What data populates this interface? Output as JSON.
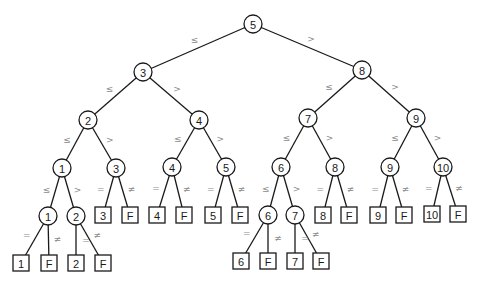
{
  "diagram": {
    "colors": {
      "line": "#1a1a1a",
      "label": "#8a8a8a",
      "background": "#ffffff"
    },
    "node_radius": 9,
    "box_size": 16,
    "nodes": [
      {
        "id": "n5",
        "type": "circle",
        "label": "5",
        "x": 253,
        "y": 24
      },
      {
        "id": "n3",
        "type": "circle",
        "label": "3",
        "x": 143,
        "y": 72
      },
      {
        "id": "n8",
        "type": "circle",
        "label": "8",
        "x": 362,
        "y": 70
      },
      {
        "id": "n2",
        "type": "circle",
        "label": "2",
        "x": 88,
        "y": 120
      },
      {
        "id": "n4",
        "type": "circle",
        "label": "4",
        "x": 199,
        "y": 120
      },
      {
        "id": "n7",
        "type": "circle",
        "label": "7",
        "x": 308,
        "y": 118
      },
      {
        "id": "n9",
        "type": "circle",
        "label": "9",
        "x": 416,
        "y": 118
      },
      {
        "id": "n1",
        "type": "circle",
        "label": "1",
        "x": 62,
        "y": 168
      },
      {
        "id": "n3b",
        "type": "circle",
        "label": "3",
        "x": 116,
        "y": 168
      },
      {
        "id": "n4b",
        "type": "circle",
        "label": "4",
        "x": 172,
        "y": 167
      },
      {
        "id": "n5b",
        "type": "circle",
        "label": "5",
        "x": 226,
        "y": 167
      },
      {
        "id": "n6",
        "type": "circle",
        "label": "6",
        "x": 281,
        "y": 167
      },
      {
        "id": "n8b",
        "type": "circle",
        "label": "8",
        "x": 335,
        "y": 167
      },
      {
        "id": "n9b",
        "type": "circle",
        "label": "9",
        "x": 390,
        "y": 167
      },
      {
        "id": "n10",
        "type": "circle",
        "label": "10",
        "x": 443,
        "y": 167
      },
      {
        "id": "n1b",
        "type": "circle",
        "label": "1",
        "x": 48,
        "y": 216
      },
      {
        "id": "n2b",
        "type": "circle",
        "label": "2",
        "x": 76,
        "y": 216
      },
      {
        "id": "n6b",
        "type": "circle",
        "label": "6",
        "x": 268,
        "y": 215
      },
      {
        "id": "n7b",
        "type": "circle",
        "label": "7",
        "x": 295,
        "y": 215
      },
      {
        "id": "l3",
        "type": "box",
        "label": "3",
        "x": 103,
        "y": 215
      },
      {
        "id": "l3f",
        "type": "box",
        "label": "F",
        "x": 130,
        "y": 215
      },
      {
        "id": "l4",
        "type": "box",
        "label": "4",
        "x": 157,
        "y": 215
      },
      {
        "id": "l4f",
        "type": "box",
        "label": "F",
        "x": 184,
        "y": 215
      },
      {
        "id": "l5",
        "type": "box",
        "label": "5",
        "x": 213,
        "y": 215
      },
      {
        "id": "l5f",
        "type": "box",
        "label": "F",
        "x": 240,
        "y": 215
      },
      {
        "id": "l8",
        "type": "box",
        "label": "8",
        "x": 323,
        "y": 215
      },
      {
        "id": "l8f",
        "type": "box",
        "label": "F",
        "x": 349,
        "y": 215
      },
      {
        "id": "l9",
        "type": "box",
        "label": "9",
        "x": 378,
        "y": 215
      },
      {
        "id": "l9f",
        "type": "box",
        "label": "F",
        "x": 404,
        "y": 215
      },
      {
        "id": "l10",
        "type": "box",
        "label": "10",
        "x": 432,
        "y": 214
      },
      {
        "id": "l10f",
        "type": "box",
        "label": "F",
        "x": 458,
        "y": 214
      },
      {
        "id": "l1",
        "type": "box",
        "label": "1",
        "x": 21,
        "y": 263
      },
      {
        "id": "l1f",
        "type": "box",
        "label": "F",
        "x": 49,
        "y": 263
      },
      {
        "id": "l2",
        "type": "box",
        "label": "2",
        "x": 76,
        "y": 263
      },
      {
        "id": "l2f",
        "type": "box",
        "label": "F",
        "x": 103,
        "y": 263
      },
      {
        "id": "l6",
        "type": "box",
        "label": "6",
        "x": 241,
        "y": 261
      },
      {
        "id": "l6f",
        "type": "box",
        "label": "F",
        "x": 268,
        "y": 261
      },
      {
        "id": "l7",
        "type": "box",
        "label": "7",
        "x": 295,
        "y": 261
      },
      {
        "id": "l7f",
        "type": "box",
        "label": "F",
        "x": 321,
        "y": 261
      }
    ],
    "edges": [
      {
        "from": "n5",
        "to": "n3",
        "label": "≤"
      },
      {
        "from": "n5",
        "to": "n8",
        "label": ">"
      },
      {
        "from": "n3",
        "to": "n2",
        "label": "≤"
      },
      {
        "from": "n3",
        "to": "n4",
        "label": ">"
      },
      {
        "from": "n8",
        "to": "n7",
        "label": "≤"
      },
      {
        "from": "n8",
        "to": "n9",
        "label": ">"
      },
      {
        "from": "n2",
        "to": "n1",
        "label": "≤"
      },
      {
        "from": "n2",
        "to": "n3b",
        "label": ">"
      },
      {
        "from": "n4",
        "to": "n4b",
        "label": "≤"
      },
      {
        "from": "n4",
        "to": "n5b",
        "label": ">"
      },
      {
        "from": "n7",
        "to": "n6",
        "label": "≤"
      },
      {
        "from": "n7",
        "to": "n8b",
        "label": ">"
      },
      {
        "from": "n9",
        "to": "n9b",
        "label": "≤"
      },
      {
        "from": "n9",
        "to": "n10",
        "label": ">"
      },
      {
        "from": "n1",
        "to": "n1b",
        "label": "≤"
      },
      {
        "from": "n1",
        "to": "n2b",
        "label": ">"
      },
      {
        "from": "n3b",
        "to": "l3",
        "label": "="
      },
      {
        "from": "n3b",
        "to": "l3f",
        "label": "≠"
      },
      {
        "from": "n4b",
        "to": "l4",
        "label": "="
      },
      {
        "from": "n4b",
        "to": "l4f",
        "label": "≠"
      },
      {
        "from": "n5b",
        "to": "l5",
        "label": "="
      },
      {
        "from": "n5b",
        "to": "l5f",
        "label": "≠"
      },
      {
        "from": "n6",
        "to": "n6b",
        "label": "≤"
      },
      {
        "from": "n6",
        "to": "n7b",
        "label": ">"
      },
      {
        "from": "n8b",
        "to": "l8",
        "label": "="
      },
      {
        "from": "n8b",
        "to": "l8f",
        "label": "≠"
      },
      {
        "from": "n9b",
        "to": "l9",
        "label": "="
      },
      {
        "from": "n9b",
        "to": "l9f",
        "label": "≠"
      },
      {
        "from": "n10",
        "to": "l10",
        "label": "="
      },
      {
        "from": "n10",
        "to": "l10f",
        "label": "≠"
      },
      {
        "from": "n1b",
        "to": "l1",
        "label": "="
      },
      {
        "from": "n1b",
        "to": "l1f",
        "label": "≠"
      },
      {
        "from": "n2b",
        "to": "l2",
        "label": "="
      },
      {
        "from": "n2b",
        "to": "l2f",
        "label": "≠"
      },
      {
        "from": "n6b",
        "to": "l6",
        "label": "="
      },
      {
        "from": "n6b",
        "to": "l6f",
        "label": "≠"
      },
      {
        "from": "n7b",
        "to": "l7",
        "label": "="
      },
      {
        "from": "n7b",
        "to": "l7f",
        "label": "≠"
      }
    ]
  }
}
